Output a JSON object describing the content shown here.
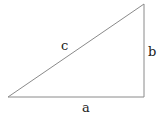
{
  "diagram": {
    "type": "right-triangle",
    "stroke_color": "#8a8a8a",
    "labels": {
      "hypotenuse": "c",
      "vertical_leg": "b",
      "horizontal_leg": "a"
    }
  }
}
